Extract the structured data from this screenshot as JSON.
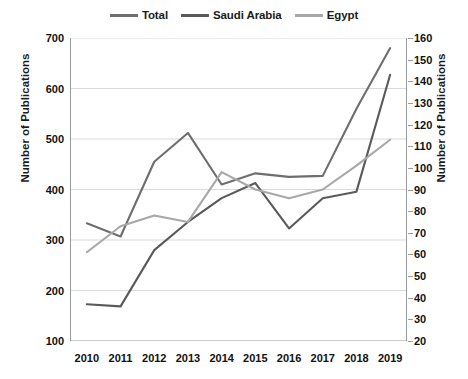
{
  "chart_data": {
    "type": "line",
    "title": "",
    "subtitle": "",
    "xlabel": "",
    "ylabel": "Number of Publications",
    "y2label": "Number of Publications",
    "categories": [
      "2010",
      "2011",
      "2012",
      "2013",
      "2014",
      "2015",
      "2016",
      "2017",
      "2018",
      "2019"
    ],
    "x": [
      2010,
      2011,
      2012,
      2013,
      2014,
      2015,
      2016,
      2017,
      2018,
      2019
    ],
    "ylim": [
      100,
      700
    ],
    "y2lim": [
      20,
      160
    ],
    "yticks": [
      100,
      200,
      300,
      400,
      500,
      600,
      700
    ],
    "y2ticks": [
      20,
      30,
      40,
      50,
      60,
      70,
      80,
      90,
      100,
      110,
      120,
      130,
      140,
      150,
      160
    ],
    "grid": true,
    "legend_position": "top-center",
    "series": [
      {
        "name": "Total",
        "axis": "left",
        "color": "#6e6e6e",
        "values": [
          333,
          307,
          455,
          512,
          410,
          432,
          425,
          427,
          560,
          680
        ]
      },
      {
        "name": "Saudi Arabia",
        "axis": "right",
        "color": "#5a5a5a",
        "values": [
          37,
          36,
          62,
          75,
          86,
          93,
          72,
          86,
          89,
          143
        ]
      },
      {
        "name": "Egypt",
        "axis": "right",
        "color": "#a8a8a8",
        "values": [
          61,
          73,
          78,
          75,
          98,
          90,
          86,
          90,
          101,
          113
        ]
      }
    ]
  },
  "legend": {
    "items": [
      {
        "label": "Total",
        "color": "#6e6e6e"
      },
      {
        "label": "Saudi Arabia",
        "color": "#5a5a5a"
      },
      {
        "label": "Egypt",
        "color": "#a8a8a8"
      }
    ]
  },
  "axes": {
    "left": {
      "title": "Number of Publications",
      "labels": [
        "700",
        "600",
        "500",
        "400",
        "300",
        "200",
        "100"
      ]
    },
    "right": {
      "title": "Number of Publications",
      "labels": [
        "160",
        "150",
        "140",
        "130",
        "120",
        "110",
        "100",
        "90",
        "80",
        "70",
        "60",
        "50",
        "40",
        "30",
        "20"
      ]
    },
    "bottom": {
      "labels": [
        "2010",
        "2011",
        "2012",
        "2013",
        "2014",
        "2015",
        "2016",
        "2017",
        "2018",
        "2019"
      ]
    }
  },
  "colors": {
    "grid": "#d9d9d9",
    "axis": "#9a9a9a",
    "text": "#111111",
    "background": "#ffffff"
  }
}
